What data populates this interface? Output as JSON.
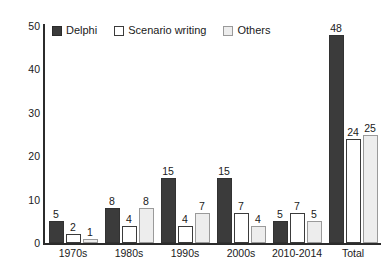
{
  "chart_data": {
    "type": "bar",
    "title": "",
    "xlabel": "",
    "ylabel": "",
    "ylim": [
      0,
      50
    ],
    "yticks": [
      0,
      10,
      20,
      30,
      40,
      50
    ],
    "grid": false,
    "legend_position": "top-left",
    "categories": [
      "1970s",
      "1980s",
      "1990s",
      "2000s",
      "2010-2014",
      "Total"
    ],
    "series": [
      {
        "name": "Delphi",
        "color": "#3b3b3b",
        "values": [
          5,
          8,
          15,
          15,
          5,
          48
        ]
      },
      {
        "name": "Scenario writing",
        "color": "#ffffff",
        "values": [
          2,
          4,
          4,
          7,
          7,
          24
        ]
      },
      {
        "name": "Others",
        "color": "#ededed",
        "values": [
          1,
          8,
          7,
          4,
          5,
          25
        ]
      }
    ]
  },
  "legend": {
    "items": [
      {
        "label": "Delphi",
        "swatch": "delphi"
      },
      {
        "label": "Scenario writing",
        "swatch": "scenario"
      },
      {
        "label": "Others",
        "swatch": "others"
      }
    ]
  },
  "axis": {
    "y_tick_labels": [
      "0",
      "10",
      "20",
      "30",
      "40",
      "50"
    ]
  }
}
